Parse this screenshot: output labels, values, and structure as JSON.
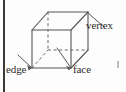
{
  "figure": {
    "kind": "geometry-diagram",
    "shape": "cube",
    "background_color": "#fdfdfd",
    "line_color": "#555553",
    "rule_color": "#3a3a38",
    "text_color": "#2e2e2c",
    "labels": [
      {
        "id": "vertex",
        "text": "vertex",
        "points_to": "top-back-right-corner"
      },
      {
        "id": "edge",
        "text": "edge",
        "points_to": "front-left-vertical-edge"
      },
      {
        "id": "face",
        "text": "face",
        "points_to": "front-face"
      }
    ],
    "cube": {
      "front_face_corners": [
        [
          32,
          30
        ],
        [
          71,
          30
        ],
        [
          71,
          68
        ],
        [
          32,
          68
        ]
      ],
      "back_face_corners": [
        [
          48,
          12
        ],
        [
          88,
          12
        ],
        [
          88,
          50
        ],
        [
          48,
          50
        ]
      ],
      "visible_edges": [
        "front-top",
        "front-right",
        "front-bottom",
        "front-left",
        "top-back-left",
        "top-back-right",
        "back-top",
        "right-back-vertical",
        "back-right-bottom"
      ],
      "hidden_edges_dashed": [
        "back-left-vertical",
        "back-bottom-left",
        "back-bottom-right"
      ]
    },
    "leader_lines": [
      {
        "for": "vertex",
        "from": [
          88,
          13
        ],
        "to": [
          104,
          27
        ]
      },
      {
        "for": "edge",
        "from": [
          32,
          68
        ],
        "to": [
          18,
          55
        ]
      },
      {
        "for": "face",
        "from": [
          71,
          68
        ],
        "to": [
          57,
          48
        ]
      }
    ]
  }
}
